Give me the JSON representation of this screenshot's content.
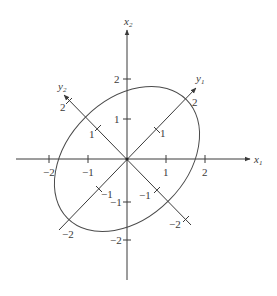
{
  "figure": {
    "origin_px": [
      127,
      159
    ],
    "unit_px": 39,
    "colors": {
      "stroke": "#3a3a3a",
      "background": "#ffffff"
    },
    "axes": {
      "x1": {
        "label": "x",
        "subscript": "1",
        "ticks": [
          "−2",
          "−1",
          "1",
          "2"
        ]
      },
      "x2": {
        "label": "x",
        "subscript": "2",
        "ticks": [
          "2",
          "1",
          "−1",
          "−2"
        ]
      },
      "y1": {
        "label": "y",
        "subscript": "1",
        "ticks": [
          "2",
          "1",
          "−1",
          "−2"
        ]
      },
      "y2": {
        "label": "y",
        "subscript": "2",
        "ticks": [
          "2",
          "1",
          "−1",
          "−2"
        ]
      }
    },
    "ellipse": {
      "center": [
        0,
        0
      ],
      "major_axis_direction": "y1",
      "semi_major_units": 2,
      "semi_minor_units": 1.4,
      "rotation_deg": 45
    }
  }
}
